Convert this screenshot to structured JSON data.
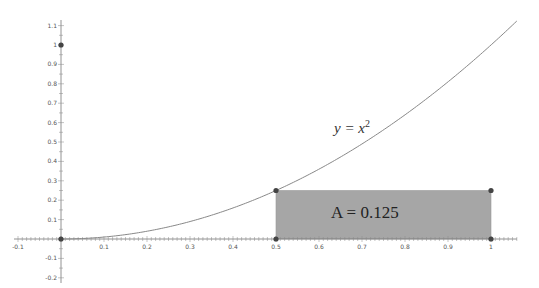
{
  "chart_data": {
    "type": "line",
    "title": "",
    "xlabel": "",
    "ylabel": "",
    "xlim": [
      -0.11,
      1.06
    ],
    "ylim": [
      -0.22,
      1.15
    ],
    "grid": false,
    "legend": null,
    "x_ticks": [
      -0.1,
      0.1,
      0.2,
      0.3,
      0.4,
      0.5,
      0.6,
      0.7,
      0.8,
      0.9,
      1
    ],
    "x_tick_labels": [
      "-0.1",
      "0.1",
      "0.2",
      "0.3",
      "0.4",
      "0.5",
      "0.6",
      "0.7",
      "0.8",
      "0.9",
      "1"
    ],
    "y_ticks": [
      -0.2,
      -0.1,
      0.1,
      0.2,
      0.3,
      0.4,
      0.5,
      0.6,
      0.7,
      0.8,
      0.9,
      1,
      1.1
    ],
    "y_tick_labels": [
      "-0.2",
      "-0.1",
      "0.1",
      "0.2",
      "0.3",
      "0.4",
      "0.5",
      "0.6",
      "0.7",
      "0.8",
      "0.9",
      "1",
      "1.1"
    ],
    "series": [
      {
        "name": "y = x^2",
        "function": "x^2",
        "x_range": [
          0,
          1.06
        ],
        "color": "#888888"
      }
    ],
    "rectangle": {
      "x0": 0.5,
      "x1": 1,
      "y0": 0,
      "y1": 0.25,
      "fill": "#a6a6a6",
      "label": "A = 0.125"
    },
    "points": [
      {
        "x": 0,
        "y": 0
      },
      {
        "x": 0,
        "y": 1
      },
      {
        "x": 0.5,
        "y": 0
      },
      {
        "x": 0.5,
        "y": 0.25
      },
      {
        "x": 1,
        "y": 0
      },
      {
        "x": 1,
        "y": 0.25
      }
    ],
    "annotations": [
      {
        "text": "y = x",
        "superscript": "2",
        "x": 0.63,
        "y": 0.57
      },
      {
        "text": "A = 0.125",
        "x": 0.75,
        "y": 0.11
      }
    ]
  },
  "labels": {
    "curve_base": "y = x",
    "curve_exp": "2",
    "area": "A = 0.125"
  }
}
